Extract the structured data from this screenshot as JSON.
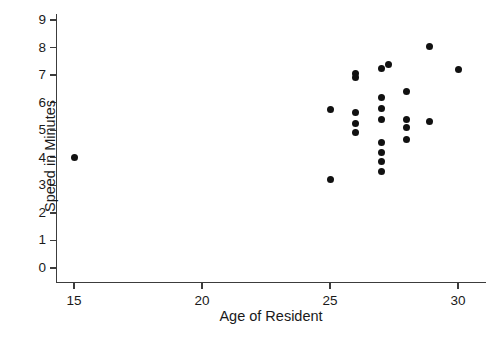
{
  "chart_data": {
    "type": "scatter",
    "title": "",
    "xlabel": "Age of Resident",
    "ylabel": "Speed in Minutes",
    "xlim": [
      14.3,
      30.8
    ],
    "ylim": [
      -0.55,
      9.35
    ],
    "xticks": [
      15,
      20,
      25,
      30
    ],
    "yticks": [
      0,
      1,
      2,
      3,
      4,
      5,
      6,
      7,
      8,
      9
    ],
    "grid": false,
    "legend": null,
    "marker": {
      "shape": "circle",
      "color": "#111111",
      "size_px": 7
    },
    "points": [
      {
        "x": 15.0,
        "y": 4.0
      },
      {
        "x": 25.0,
        "y": 5.75
      },
      {
        "x": 25.0,
        "y": 3.2
      },
      {
        "x": 26.0,
        "y": 7.05
      },
      {
        "x": 26.0,
        "y": 6.9
      },
      {
        "x": 26.0,
        "y": 5.65
      },
      {
        "x": 26.0,
        "y": 5.25
      },
      {
        "x": 26.0,
        "y": 4.9
      },
      {
        "x": 27.0,
        "y": 7.25
      },
      {
        "x": 27.0,
        "y": 6.2
      },
      {
        "x": 27.0,
        "y": 5.8
      },
      {
        "x": 27.0,
        "y": 5.4
      },
      {
        "x": 27.0,
        "y": 4.55
      },
      {
        "x": 27.0,
        "y": 4.2
      },
      {
        "x": 27.0,
        "y": 3.85
      },
      {
        "x": 27.0,
        "y": 3.5
      },
      {
        "x": 27.3,
        "y": 7.4
      },
      {
        "x": 28.0,
        "y": 6.4
      },
      {
        "x": 28.0,
        "y": 5.4
      },
      {
        "x": 28.0,
        "y": 5.1
      },
      {
        "x": 28.0,
        "y": 4.65
      },
      {
        "x": 28.9,
        "y": 8.05
      },
      {
        "x": 28.9,
        "y": 5.3
      },
      {
        "x": 30.0,
        "y": 7.2
      }
    ]
  },
  "caption": {
    "text": ""
  }
}
